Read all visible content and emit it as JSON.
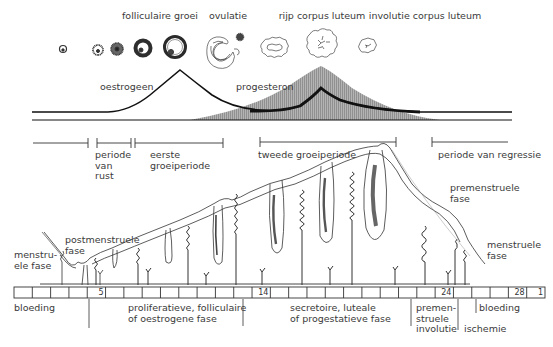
{
  "ovary": {
    "labels": [
      {
        "id": "folliculaire-groei",
        "text": "folliculaire groei",
        "x": 160,
        "y": 12
      },
      {
        "id": "ovulatie",
        "text": "ovulatie",
        "x": 228,
        "y": 12
      },
      {
        "id": "rijp-corpus-luteum",
        "text": "rijp corpus luteum",
        "x": 322,
        "y": 12
      },
      {
        "id": "involutie-corpus-luteum",
        "text": "involutie corpus luteum",
        "x": 425,
        "y": 12
      }
    ],
    "stages": [
      "primordial follicle",
      "primary follicle",
      "secondary follicle",
      "antral follicle",
      "graafian follicle",
      "ovulation",
      "early corpus luteum",
      "mature corpus luteum",
      "corpus luteum involution"
    ]
  },
  "hormones": {
    "oestrogeen_label": "oestrogeen",
    "progesteron_label": "progesteron",
    "colors": {
      "line": "#111111",
      "shade": "#9a9a9a"
    }
  },
  "periods": {
    "labels": {
      "rust": "periode\nvan\nrust",
      "rust_lines": [
        "periode",
        "van",
        "rust"
      ],
      "eerste_lines": [
        "eerste",
        "groeiperiode"
      ],
      "tweede": "tweede groeiperiode",
      "regressie": "periode van regressie"
    }
  },
  "endometrium": {
    "labels": {
      "menstruele_links": [
        "menstru-",
        "ele fase"
      ],
      "postmenstruele": [
        "postmenstruele",
        "fase"
      ],
      "premenstruele": [
        "premenstruele",
        "fase"
      ],
      "menstruele_rechts": [
        "menstruele",
        "fase"
      ]
    }
  },
  "timeline": {
    "cell_count": 29,
    "numbers": [
      {
        "day": "5",
        "cell": 4
      },
      {
        "day": "14",
        "cell": 13
      },
      {
        "day": "24",
        "cell": 23
      },
      {
        "day": "28",
        "cell": 27
      },
      {
        "day": "1",
        "cell": 28
      }
    ]
  },
  "phases": {
    "bloeding_start": "bloeding",
    "proliferatief": [
      "proliferatieve, folliculaire",
      "of oestrogene fase"
    ],
    "secretoir": [
      "secretoire, luteale",
      "of progestatieve fase"
    ],
    "premenstrueel": [
      "premen-",
      "struele",
      "involutie"
    ],
    "ischemie": "ischemie",
    "bloeding_end": "bloeding"
  }
}
